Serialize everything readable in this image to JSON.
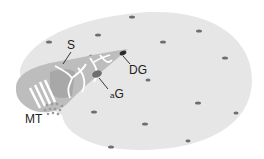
{
  "diagram": {
    "labels": {
      "S": "S",
      "DG": "DG",
      "aG_prefix": "a",
      "aG": "G",
      "MT": "MT"
    },
    "colors": {
      "cell": "#e6e6e6",
      "wedge": "#bdbdbd",
      "wedge_dark": "#a8a8a8",
      "granule": "#6e6e6e",
      "dg": "#2a2a2a",
      "lines": "#ffffff",
      "text": "#222222"
    }
  }
}
